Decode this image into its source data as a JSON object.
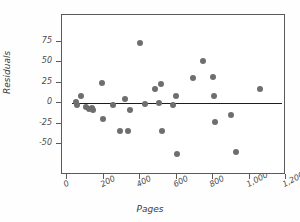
{
  "chart_data": {
    "type": "scatter",
    "title": "",
    "xlabel": "Pages",
    "ylabel": "Residuals",
    "xlim": [
      0,
      1200
    ],
    "ylim": [
      -75,
      87
    ],
    "grid": false,
    "legend": null,
    "xticks": [
      0,
      200,
      400,
      600,
      800,
      1000,
      1200
    ],
    "xtick_labels": [
      "0",
      "200",
      "400",
      "600",
      "800",
      "1,000",
      "1,200"
    ],
    "yticks": [
      75,
      50,
      25,
      0,
      -25,
      -50
    ],
    "ytick_labels": [
      "75",
      "50",
      "25",
      "0",
      "-25",
      "-50"
    ],
    "marker_color": "#6e6e6e",
    "line_color": "#1c1c1c",
    "axis_color": "#5a5a5a",
    "reference_line": {
      "y": 0,
      "x_start": 30,
      "x_end": 1180
    },
    "points": [
      {
        "x": 50,
        "y": 1
      },
      {
        "x": 55,
        "y": -2
      },
      {
        "x": 75,
        "y": 9
      },
      {
        "x": 105,
        "y": -5
      },
      {
        "x": 120,
        "y": -7
      },
      {
        "x": 135,
        "y": -6
      },
      {
        "x": 140,
        "y": -8
      },
      {
        "x": 190,
        "y": 25
      },
      {
        "x": 195,
        "y": -20
      },
      {
        "x": 250,
        "y": -2
      },
      {
        "x": 290,
        "y": -34
      },
      {
        "x": 320,
        "y": 5
      },
      {
        "x": 335,
        "y": -34
      },
      {
        "x": 345,
        "y": -8
      },
      {
        "x": 400,
        "y": 73
      },
      {
        "x": 425,
        "y": -1
      },
      {
        "x": 480,
        "y": 17
      },
      {
        "x": 505,
        "y": 0
      },
      {
        "x": 515,
        "y": 23
      },
      {
        "x": 520,
        "y": -34
      },
      {
        "x": 580,
        "y": -2
      },
      {
        "x": 595,
        "y": 9
      },
      {
        "x": 600,
        "y": -62
      },
      {
        "x": 690,
        "y": 31
      },
      {
        "x": 745,
        "y": 51
      },
      {
        "x": 800,
        "y": 32
      },
      {
        "x": 805,
        "y": 9
      },
      {
        "x": 810,
        "y": -23
      },
      {
        "x": 900,
        "y": -15
      },
      {
        "x": 925,
        "y": -60
      },
      {
        "x": 1060,
        "y": 17
      }
    ]
  }
}
